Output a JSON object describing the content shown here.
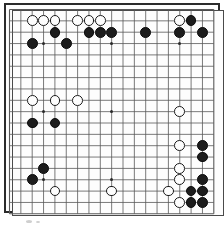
{
  "app": {
    "title": "Go Board Diagram",
    "description": "Scanned 19x19 go board position diagram"
  },
  "board": {
    "size": 19,
    "origin_x": 9.5,
    "origin_y": 9.5,
    "spacing": 11.35,
    "line_color": "#585858",
    "border_color": "#2b2b2b",
    "background_color": "#fdfdfd",
    "black_color": "#1c1c1c",
    "white_color": "#fdfdfd",
    "stone_radius": 5.4,
    "hoshi_radius": 1.6,
    "hoshi_points": [
      [
        4,
        4
      ],
      [
        10,
        4
      ],
      [
        16,
        4
      ],
      [
        4,
        10
      ],
      [
        10,
        10
      ],
      [
        16,
        10
      ],
      [
        4,
        16
      ],
      [
        10,
        16
      ],
      [
        16,
        16
      ]
    ],
    "column_labels": [
      "A",
      "B",
      "C",
      "D",
      "E",
      "F",
      "G",
      "H",
      "J",
      "K",
      "L",
      "M",
      "N",
      "O",
      "P",
      "Q",
      "R",
      "S",
      "T"
    ],
    "row_labels": [
      "19",
      "18",
      "17",
      "16",
      "15",
      "14",
      "13",
      "12",
      "11",
      "10",
      "9",
      "8",
      "7",
      "6",
      "5",
      "4",
      "3",
      "2",
      "1"
    ]
  },
  "chart_data": {
    "type": "table",
    "xlabel": "Board column (1-19, left to right)",
    "ylabel": "Board row (1-19, top to bottom)",
    "black_count": 26,
    "white_count": 18,
    "black_stones": [
      [
        5,
        3
      ],
      [
        3,
        4
      ],
      [
        6,
        4
      ],
      [
        8,
        3
      ],
      [
        9,
        3
      ],
      [
        10,
        3
      ],
      [
        13,
        3
      ],
      [
        17,
        2
      ],
      [
        16,
        3
      ],
      [
        18,
        3
      ],
      [
        3,
        11
      ],
      [
        5,
        11
      ],
      [
        18,
        13
      ],
      [
        18,
        14
      ],
      [
        18,
        16
      ],
      [
        17,
        17
      ],
      [
        18,
        17
      ],
      [
        17,
        18
      ],
      [
        18,
        18
      ],
      [
        4,
        15
      ],
      [
        3,
        16
      ]
    ],
    "white_stones": [
      [
        3,
        2
      ],
      [
        4,
        2
      ],
      [
        5,
        2
      ],
      [
        7,
        2
      ],
      [
        8,
        2
      ],
      [
        9,
        2
      ],
      [
        16,
        2
      ],
      [
        3,
        9
      ],
      [
        5,
        9
      ],
      [
        7,
        9
      ],
      [
        16,
        10
      ],
      [
        16,
        13
      ],
      [
        16,
        15
      ],
      [
        16,
        16
      ],
      [
        15,
        17
      ],
      [
        16,
        18
      ],
      [
        5,
        17
      ],
      [
        10,
        17
      ]
    ]
  }
}
